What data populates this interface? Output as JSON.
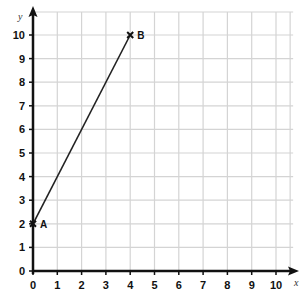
{
  "chart_data": {
    "type": "line",
    "title": "",
    "xlabel": "x",
    "ylabel": "y",
    "xlim": [
      0,
      10.5
    ],
    "ylim": [
      0,
      10.5
    ],
    "grid": true,
    "x_ticks": [
      "0",
      "1",
      "2",
      "3",
      "4",
      "5",
      "6",
      "7",
      "8",
      "9",
      "10"
    ],
    "y_ticks": [
      "0",
      "1",
      "2",
      "3",
      "4",
      "5",
      "6",
      "7",
      "8",
      "9",
      "10"
    ],
    "points": [
      {
        "label": "A",
        "x": 0,
        "y": 2
      },
      {
        "label": "B",
        "x": 4,
        "y": 10
      }
    ],
    "series": [
      {
        "name": "AB",
        "x": [
          0,
          4
        ],
        "y": [
          2,
          10
        ]
      }
    ],
    "colors": {
      "grid": "#d4d4d4",
      "axis": "#111111",
      "line": "#222222"
    }
  }
}
